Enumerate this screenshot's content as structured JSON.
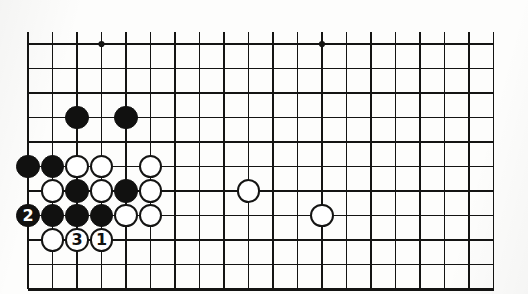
{
  "figure": {
    "kind": "go-board-diagram",
    "colors": {
      "line": "#141413",
      "black_stone": "#111110",
      "white_stone": "#ffffff",
      "background": "#fdfdfc"
    }
  },
  "board": {
    "columns": 20,
    "rows": 11,
    "origin_x": 28,
    "origin_y": 44,
    "spacing": 24.5,
    "edges": {
      "left": true,
      "bottom": true,
      "top": false,
      "right": false
    },
    "star_points": [
      {
        "col": 3,
        "row": 0
      },
      {
        "col": 12,
        "row": 0
      },
      {
        "col": 21,
        "row": 0
      },
      {
        "col": 21,
        "row": 6
      }
    ]
  },
  "stones": [
    {
      "color": "black",
      "col": 2,
      "row": 3,
      "label": ""
    },
    {
      "color": "black",
      "col": 4,
      "row": 3,
      "label": ""
    },
    {
      "color": "black",
      "col": 0,
      "row": 5,
      "label": ""
    },
    {
      "color": "black",
      "col": 1,
      "row": 5,
      "label": ""
    },
    {
      "color": "white",
      "col": 2,
      "row": 5,
      "label": ""
    },
    {
      "color": "white",
      "col": 3,
      "row": 5,
      "label": ""
    },
    {
      "color": "white",
      "col": 5,
      "row": 5,
      "label": ""
    },
    {
      "color": "white",
      "col": 1,
      "row": 6,
      "label": ""
    },
    {
      "color": "black",
      "col": 2,
      "row": 6,
      "label": ""
    },
    {
      "color": "white",
      "col": 3,
      "row": 6,
      "label": ""
    },
    {
      "color": "black",
      "col": 4,
      "row": 6,
      "label": ""
    },
    {
      "color": "white",
      "col": 5,
      "row": 6,
      "label": ""
    },
    {
      "color": "white",
      "col": 9,
      "row": 6,
      "label": ""
    },
    {
      "color": "black",
      "col": 0,
      "row": 7,
      "label": "2"
    },
    {
      "color": "black",
      "col": 1,
      "row": 7,
      "label": ""
    },
    {
      "color": "black",
      "col": 2,
      "row": 7,
      "label": ""
    },
    {
      "color": "black",
      "col": 3,
      "row": 7,
      "label": ""
    },
    {
      "color": "white",
      "col": 4,
      "row": 7,
      "label": ""
    },
    {
      "color": "white",
      "col": 5,
      "row": 7,
      "label": ""
    },
    {
      "color": "white",
      "col": 12,
      "row": 7,
      "label": ""
    },
    {
      "color": "white",
      "col": 1,
      "row": 8,
      "label": ""
    },
    {
      "color": "white",
      "col": 2,
      "row": 8,
      "label": "3"
    },
    {
      "color": "white",
      "col": 3,
      "row": 8,
      "label": "1"
    }
  ],
  "move_numbers": [
    {
      "number": "1",
      "color": "white"
    },
    {
      "number": "2",
      "color": "black"
    },
    {
      "number": "3",
      "color": "white"
    }
  ]
}
